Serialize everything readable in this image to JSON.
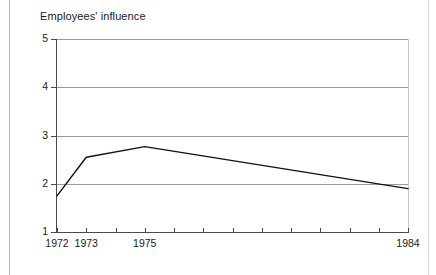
{
  "chart_data": {
    "type": "line",
    "title": "Employees' influence",
    "xlabel": "",
    "ylabel": "",
    "grid": true,
    "legend": false,
    "xlim": [
      1972,
      1984
    ],
    "ylim": [
      1,
      5
    ],
    "yticks": [
      1,
      2,
      3,
      4,
      5
    ],
    "ytick_labels": [
      "1",
      "2",
      "3",
      "4",
      "5"
    ],
    "xticks": [
      1972,
      1973,
      1974,
      1975,
      1976,
      1977,
      1978,
      1979,
      1980,
      1981,
      1982,
      1983,
      1984
    ],
    "xtick_labels": [
      "1972",
      "1973",
      "",
      "1975",
      "",
      "",
      "",
      "",
      "",
      "",
      "",
      "",
      "1984"
    ],
    "series": [
      {
        "name": "Employees' influence",
        "color": "#111111",
        "x": [
          1972,
          1973,
          1975,
          1984
        ],
        "values": [
          1.75,
          2.55,
          2.77,
          1.9
        ]
      }
    ]
  },
  "colors": {
    "gridline": "#9a9a9a",
    "axis": "#4a4a4a",
    "line": "#111111",
    "page_rule": "#b9b9b9"
  }
}
